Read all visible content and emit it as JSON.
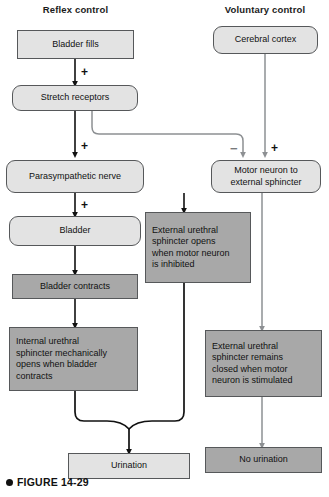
{
  "figure": {
    "bullet": "●",
    "label": "FIGURE 14-29"
  },
  "headers": {
    "left": "Reflex control",
    "right": "Voluntary control"
  },
  "nodes": {
    "bladder_fills": "Bladder fills",
    "stretch_receptors": "Stretch receptors",
    "cerebral_cortex": "Cerebral cortex",
    "parasympathetic_nerve": "Parasympathetic nerve",
    "motor_neuron": "Motor neuron to\nexternal sphincter",
    "motor_neuron_l1": "Motor neuron to",
    "motor_neuron_l2": "external sphincter",
    "bladder": "Bladder",
    "bladder_contracts": "Bladder contracts",
    "eus_opens_l1": "External urethral",
    "eus_opens_l2": "sphincter opens",
    "eus_opens_l3": "when motor neuron",
    "eus_opens_l4": "is inhibited",
    "ius_opens_l1": "Internal urethral",
    "ius_opens_l2": "sphincter mechanically",
    "ius_opens_l3": "opens when bladder",
    "ius_opens_l4": "contracts",
    "eus_closed_l1": "External urethral",
    "eus_closed_l2": "sphincter remains",
    "eus_closed_l3": "closed when motor",
    "eus_closed_l4": "neuron is stimulated",
    "urination": "Urination",
    "no_urination": "No urination"
  },
  "signs": {
    "plus_bladder_to_stretch": "+",
    "plus_stretch_to_para": "+",
    "plus_para_to_bladder": "+",
    "minus_to_motor": "−",
    "plus_cortex_to_motor": "+"
  },
  "colors": {
    "light_fill": "#e3e3e3",
    "dark_fill": "#a8a8a8",
    "border": "#56585a",
    "arrow_black": "#111111",
    "arrow_gray": "#8d9093",
    "text": "#111111",
    "page_background": "#ffffff"
  }
}
